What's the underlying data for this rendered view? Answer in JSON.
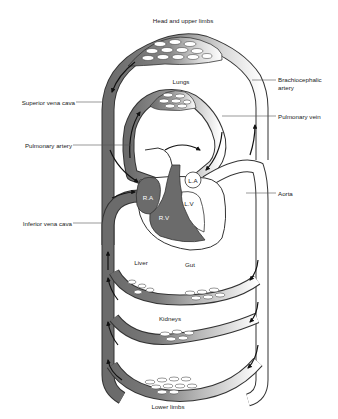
{
  "diagram": {
    "colors": {
      "deoxygenated": "#6b6b6b",
      "oxygenated": "#ffffff",
      "outline": "#333333",
      "arrow": "#111111",
      "leader_line": "#555555",
      "background": "#ffffff"
    },
    "labels": {
      "head": "Head and upper limbs",
      "lungs": "Lungs",
      "brachiocephalic_1": "Brachiocephalic",
      "brachiocephalic_2": "artery",
      "superior_vena_cava": "Superior vena cava",
      "pulmonary_vein": "Pulmonary vein",
      "pulmonary_artery": "Pulmonary artery",
      "aorta": "Aorta",
      "inferior_vena_cava": "Inferior vena cava",
      "ra": "R.A",
      "la": "L.A",
      "lv": "L.V",
      "rv": "R.V",
      "liver": "Liver",
      "gut": "Gut",
      "kidneys": "Kidneys",
      "lower_limbs": "Lower limbs"
    },
    "capillary_beds": [
      "Head and upper limbs",
      "Lungs",
      "Liver",
      "Gut",
      "Kidneys",
      "Lower limbs"
    ],
    "heart_chambers": [
      "R.A",
      "R.V",
      "L.A",
      "L.V"
    ]
  }
}
